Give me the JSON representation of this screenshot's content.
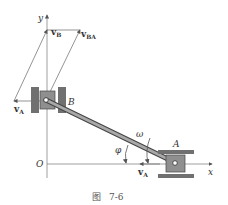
{
  "figure": {
    "caption_prefix": "图",
    "caption_number": "7-6"
  },
  "labels": {
    "y_axis": "y",
    "x_axis": "x",
    "origin": "O",
    "point_a": "A",
    "point_b": "B",
    "omega": "ω",
    "phi": "φ",
    "vB": "v",
    "vB_sub": "B",
    "vBA": "v",
    "vBA_sub": "BA",
    "vA_left": "v",
    "vA_left_sub": "A",
    "vA_bottom": "v",
    "vA_bottom_sub": "A"
  },
  "colors": {
    "line": "#555555",
    "rod_fill": "#9a9a9a",
    "slider_fill": "#8f8f8f",
    "guide_fill": "#6e6e6e"
  }
}
